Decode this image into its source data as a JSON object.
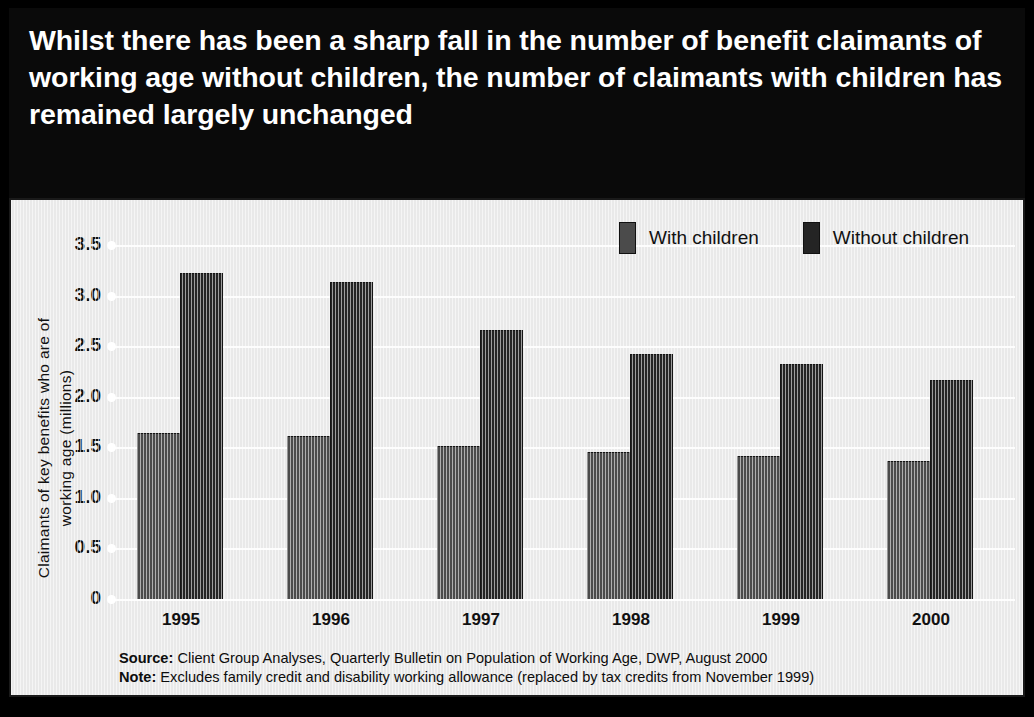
{
  "title": "Whilst there has been a sharp fall in the number of benefit claimants of working age without children, the number of claimants with children has remained largely unchanged",
  "colors": {
    "frame": "#000000",
    "title_band": "#0a0a0a",
    "panel_background": "#e9e9e9",
    "gridline": "#fdfdfd",
    "with_children_bar": "#4b4b4b",
    "without_children_bar": "#242424",
    "text": "#111111"
  },
  "legend": {
    "position": "top-right",
    "entries": [
      {
        "label": "With children",
        "color": "#4b4b4b"
      },
      {
        "label": "Without children",
        "color": "#242424"
      }
    ]
  },
  "axes": {
    "y_title_line1": "Claimants of key benefits who are of",
    "y_title_line2": "working age (millions)",
    "y_ticks": [
      "3.5",
      "3.0",
      "2.5",
      "2.0",
      "1.5",
      "1.0",
      "0.5",
      "0"
    ]
  },
  "footnotes": [
    {
      "label": "Source",
      "text": "Client Group Analyses, Quarterly Bulletin on Population of Working Age, DWP, August 2000"
    },
    {
      "label": "Note",
      "text": "Excludes family credit and disability working allowance (replaced by tax credits from November 1999)"
    }
  ],
  "chart_data": {
    "type": "bar",
    "title": "Whilst there has been a sharp fall in the number of benefit claimants of working age without children, the number of claimants with children has remained largely unchanged",
    "xlabel": "",
    "ylabel": "Claimants of key benefits who are of working age (millions)",
    "ylim": [
      0,
      3.5
    ],
    "yticks": [
      0,
      0.5,
      1.0,
      1.5,
      2.0,
      2.5,
      3.0,
      3.5
    ],
    "grid": true,
    "grid_axis": "y",
    "legend_position": "top-right",
    "categories": [
      "1995",
      "1996",
      "1997",
      "1998",
      "1999",
      "2000"
    ],
    "series": [
      {
        "name": "With children",
        "color": "#4b4b4b",
        "values": [
          1.64,
          1.61,
          1.51,
          1.45,
          1.41,
          1.36
        ]
      },
      {
        "name": "Without children",
        "color": "#242424",
        "values": [
          3.22,
          3.13,
          2.66,
          2.42,
          2.32,
          2.17
        ]
      }
    ],
    "units": "millions"
  }
}
